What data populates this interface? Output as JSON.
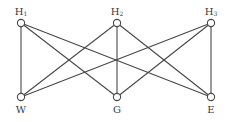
{
  "diagram": {
    "type": "bipartite-graph",
    "name": "K3,3 utility graph",
    "colors": {
      "stroke": "#474747",
      "node_fill": "#ffffff",
      "text": "#3a3a3a",
      "background": "#ffffff"
    },
    "node_radius": 3.6,
    "top_nodes": [
      {
        "id": "H1",
        "letter": "H",
        "sub": "1",
        "x": 21,
        "y": 23
      },
      {
        "id": "H2",
        "letter": "H",
        "sub": "2",
        "x": 117,
        "y": 23
      },
      {
        "id": "H3",
        "letter": "H",
        "sub": "3",
        "x": 211,
        "y": 23
      }
    ],
    "bottom_nodes": [
      {
        "id": "W",
        "letter": "W",
        "sub": "",
        "x": 21,
        "y": 97
      },
      {
        "id": "G",
        "letter": "G",
        "sub": "",
        "x": 117,
        "y": 97
      },
      {
        "id": "E",
        "letter": "E",
        "sub": "",
        "x": 211,
        "y": 97
      }
    ],
    "edges": [
      [
        "H1",
        "W"
      ],
      [
        "H1",
        "G"
      ],
      [
        "H1",
        "E"
      ],
      [
        "H2",
        "W"
      ],
      [
        "H2",
        "G"
      ],
      [
        "H2",
        "E"
      ],
      [
        "H3",
        "W"
      ],
      [
        "H3",
        "G"
      ],
      [
        "H3",
        "E"
      ]
    ]
  }
}
